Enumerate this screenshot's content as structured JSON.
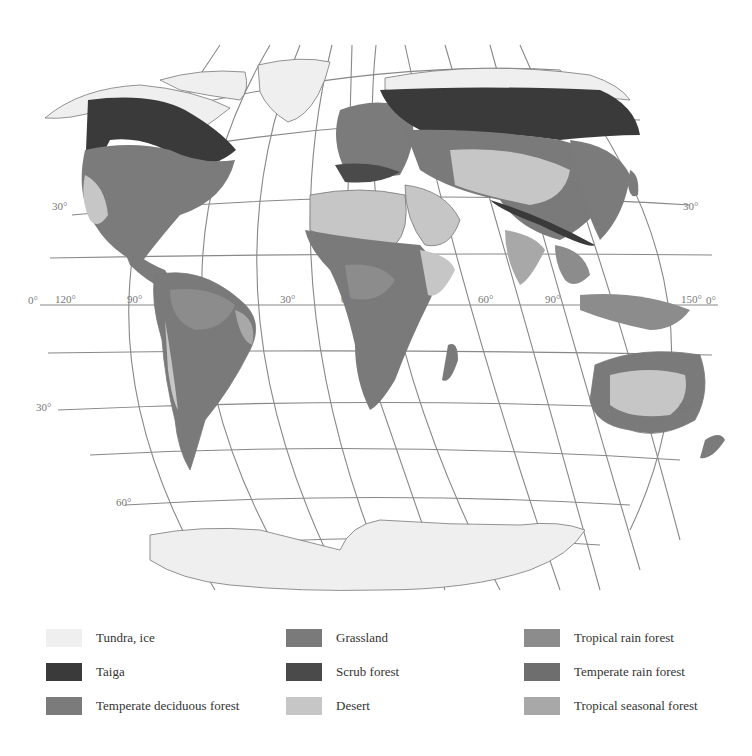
{
  "map": {
    "title": "World biomes",
    "projection": "Robinson-like elliptical",
    "latitude_labels": [
      {
        "text": "30°",
        "x": 52,
        "y": 210
      },
      {
        "text": "0°",
        "x": 32,
        "y": 304
      },
      {
        "text": "30°",
        "x": 36,
        "y": 411
      },
      {
        "text": "60°",
        "x": 116,
        "y": 506
      },
      {
        "text": "30°",
        "x": 683,
        "y": 210
      },
      {
        "text": "0°",
        "x": 706,
        "y": 304
      },
      {
        "text": "30°",
        "x": 679,
        "y": 411
      }
    ],
    "longitude_labels": [
      {
        "text": "120°",
        "x": 55,
        "y": 303
      },
      {
        "text": "90°",
        "x": 127,
        "y": 303
      },
      {
        "text": "30°",
        "x": 280,
        "y": 303
      },
      {
        "text": "0°",
        "x": 341,
        "y": 303
      },
      {
        "text": "60°",
        "x": 480,
        "y": 303
      },
      {
        "text": "90°",
        "x": 545,
        "y": 303
      },
      {
        "text": "150°",
        "x": 681,
        "y": 303
      }
    ]
  },
  "legend": {
    "items": [
      {
        "label": "Tundra, ice",
        "color": "#efefef",
        "col": 0,
        "row": 0
      },
      {
        "label": "Taiga",
        "color": "#3a3a3a",
        "col": 0,
        "row": 1
      },
      {
        "label": "Temperate deciduous forest",
        "color": "#7b7b7b",
        "col": 0,
        "row": 2
      },
      {
        "label": "Grassland",
        "color": "#7a7a7a",
        "col": 1,
        "row": 0
      },
      {
        "label": "Scrub forest",
        "color": "#4a4a4a",
        "col": 1,
        "row": 1
      },
      {
        "label": "Desert",
        "color": "#c6c6c6",
        "col": 1,
        "row": 2
      },
      {
        "label": "Tropical rain forest",
        "color": "#8c8c8c",
        "col": 2,
        "row": 0
      },
      {
        "label": "Temperate rain forest",
        "color": "#6e6e6e",
        "col": 2,
        "row": 1
      },
      {
        "label": "Tropical seasonal forest",
        "color": "#a8a8a8",
        "col": 2,
        "row": 2
      }
    ]
  },
  "colors": {
    "tundra": "#efefef",
    "taiga": "#3a3a3a",
    "temperate_deciduous": "#7b7b7b",
    "grassland": "#7a7a7a",
    "scrub": "#4a4a4a",
    "desert": "#c6c6c6",
    "tropical_rain": "#8c8c8c",
    "temperate_rain": "#6e6e6e",
    "tropical_seasonal": "#a8a8a8",
    "grid": "#888888"
  }
}
